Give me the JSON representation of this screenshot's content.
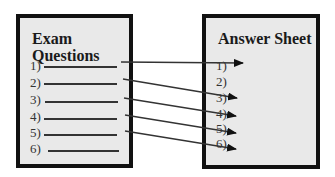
{
  "diagram": {
    "left_box": {
      "title_line1": "Exam",
      "title_line2": "Questions",
      "questions": [
        {
          "label": "1)"
        },
        {
          "label": "2)"
        },
        {
          "label": "3)"
        },
        {
          "label": "4)"
        },
        {
          "label": "5)"
        },
        {
          "label": "6)"
        }
      ]
    },
    "right_box": {
      "title": "Answer Sheet",
      "answers": [
        {
          "label": "1)"
        },
        {
          "label": "2)"
        },
        {
          "label": "3)"
        },
        {
          "label": "4)"
        },
        {
          "label": "5)"
        },
        {
          "label": "6)"
        }
      ]
    },
    "arrows": [
      {
        "from": "question 1",
        "to": "answer 1"
      },
      {
        "from": "question 2",
        "to": "answer 3"
      },
      {
        "from": "question 3",
        "to": "answer 4"
      },
      {
        "from": "question 4",
        "to": "answer 5"
      },
      {
        "from": "question 5",
        "to": "answer 6"
      }
    ],
    "colors": {
      "box_fill": "#e9e9e9",
      "box_border": "#111111",
      "line": "#333333"
    }
  }
}
